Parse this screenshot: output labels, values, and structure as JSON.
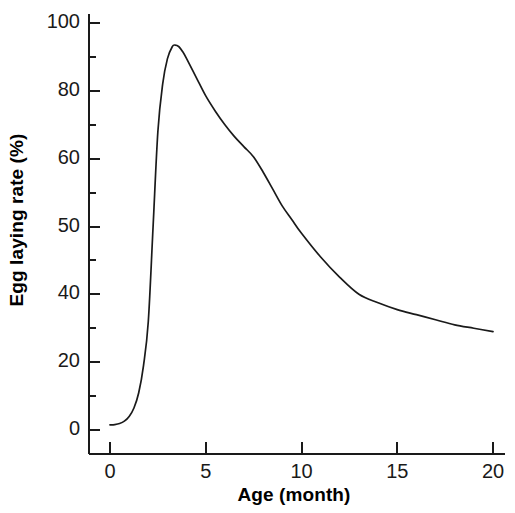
{
  "chart_data": {
    "type": "line",
    "title": "",
    "subtitle": "",
    "xlabel": "Age (month)",
    "ylabel": "Egg laying rate (%)",
    "xlim": [
      0,
      20
    ],
    "ylim": [
      0,
      100
    ],
    "grid": false,
    "legend": null,
    "x_ticks": [
      "0",
      "5",
      "10",
      "15",
      "20"
    ],
    "x_tick_values": [
      0,
      5,
      10,
      15,
      20
    ],
    "x_minor_ticks": [],
    "y_ticks": [
      "0",
      "20",
      "40",
      "50",
      "60",
      "80",
      "100"
    ],
    "y_tick_values": [
      0,
      20,
      40,
      50,
      60,
      80,
      100
    ],
    "y_tick_slots": [
      0,
      1,
      2,
      3,
      4,
      5,
      6
    ],
    "y_minor_tick_slots": [
      0.5,
      1.5,
      2.5,
      3.5,
      4.5,
      5.5
    ],
    "series": [
      {
        "name": "Egg laying rate",
        "color": "#1a1a1a",
        "x": [
          0.0,
          0.25,
          0.5,
          0.75,
          1.0,
          1.25,
          1.5,
          1.75,
          2.0,
          2.25,
          2.5,
          2.75,
          3.0,
          3.25,
          3.4,
          3.6,
          3.8,
          4.0,
          4.5,
          5.0,
          5.5,
          6.0,
          6.5,
          7.0,
          7.5,
          8.0,
          8.5,
          9.0,
          9.5,
          10.0,
          11.0,
          12.0,
          13.0,
          14.0,
          15.0,
          16.0,
          17.0,
          18.0,
          19.0,
          20.0
        ],
        "y": [
          1.5,
          1.6,
          1.9,
          2.6,
          4.0,
          6.5,
          11.0,
          19.0,
          32.0,
          50.0,
          68.0,
          82.0,
          89.5,
          93.0,
          93.5,
          93.0,
          91.5,
          89.5,
          84.0,
          78.5,
          74.0,
          70.0,
          66.5,
          63.5,
          60.5,
          58.0,
          55.5,
          53.0,
          51.0,
          49.0,
          45.5,
          42.5,
          40.0,
          37.5,
          35.5,
          34.0,
          32.5,
          31.0,
          30.0,
          29.0
        ]
      }
    ],
    "annotations": {
      "peak_value": "93.5",
      "peak_age": "3.4",
      "start_value": "1.5",
      "end_value": "29"
    },
    "axis": {
      "y_ticks_direction": "inward-right",
      "x_ticks_direction": "inward-up",
      "line_color": "#1a1a1a"
    }
  }
}
